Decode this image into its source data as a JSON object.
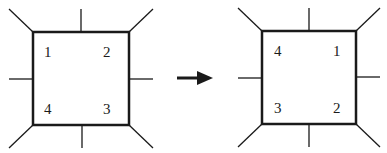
{
  "diagram": {
    "arrow": "right-arrow",
    "before": {
      "labels": {
        "top_left": "1",
        "top_right": "2",
        "bottom_right": "3",
        "bottom_left": "4"
      }
    },
    "after": {
      "labels": {
        "top_left": "4",
        "top_right": "1",
        "bottom_right": "2",
        "bottom_left": "3"
      }
    },
    "colors": {
      "stroke": "#1a1a1a",
      "background": "#ffffff"
    }
  }
}
